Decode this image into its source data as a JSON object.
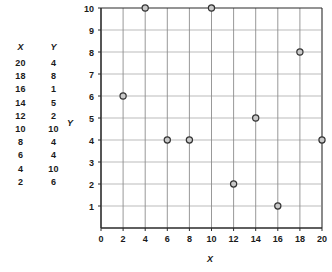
{
  "table": {
    "headers": [
      "X",
      "Y"
    ],
    "rows": [
      [
        "20",
        "4"
      ],
      [
        "18",
        "8"
      ],
      [
        "16",
        "1"
      ],
      [
        "14",
        "5"
      ],
      [
        "12",
        "2"
      ],
      [
        "10",
        "10"
      ],
      [
        "8",
        "4"
      ],
      [
        "6",
        "4"
      ],
      [
        "4",
        "10"
      ],
      [
        "2",
        "6"
      ]
    ]
  },
  "chart_data": {
    "type": "scatter",
    "title": "",
    "xlabel": "X",
    "ylabel": "Y",
    "xlim": [
      0,
      20
    ],
    "ylim": [
      0,
      10
    ],
    "xticks": [
      0,
      2,
      4,
      6,
      8,
      10,
      12,
      14,
      16,
      18,
      20
    ],
    "yticks": [
      0,
      1,
      2,
      3,
      4,
      5,
      6,
      7,
      8,
      9,
      10
    ],
    "xtick_labels": [
      "0",
      "2",
      "4",
      "6",
      "8",
      "10",
      "12",
      "14",
      "16",
      "18",
      "20"
    ],
    "ytick_labels": [
      "1",
      "2",
      "3",
      "4",
      "5",
      "6",
      "7",
      "8",
      "9",
      "10"
    ],
    "grid": true,
    "legend": null,
    "points": [
      {
        "x": 20,
        "y": 4
      },
      {
        "x": 18,
        "y": 8
      },
      {
        "x": 16,
        "y": 1
      },
      {
        "x": 14,
        "y": 5
      },
      {
        "x": 12,
        "y": 2
      },
      {
        "x": 10,
        "y": 10
      },
      {
        "x": 8,
        "y": 4
      },
      {
        "x": 6,
        "y": 4
      },
      {
        "x": 4,
        "y": 10
      },
      {
        "x": 2,
        "y": 6
      }
    ],
    "marker": {
      "shape": "circle",
      "fill": "#c9c9c9",
      "stroke": "#333333"
    },
    "colors": {
      "grid": "#6d6d6d",
      "axis": "#2b2b2b",
      "text": "#1a1a1a",
      "background": "#ffffff"
    }
  }
}
